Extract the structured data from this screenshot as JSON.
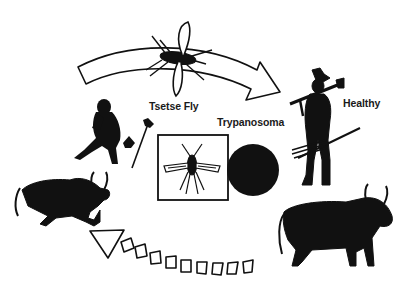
{
  "diagram": {
    "type": "disease transmission cycle",
    "labels": {
      "vector": "Tsetse Fly",
      "parasite": "Trypanosoma",
      "healthy": "Healthy"
    },
    "colors": {
      "ink": "#111111",
      "background": "#ffffff"
    },
    "nodes": [
      {
        "id": "flying-tsetse-fly",
        "desc": "tsetse fly in flight over top arrow"
      },
      {
        "id": "healthy-man",
        "desc": "standing man with hat carrying rifle and spears"
      },
      {
        "id": "healthy-cow",
        "desc": "standing humped cattle"
      },
      {
        "id": "sick-cow",
        "desc": "collapsing cattle"
      },
      {
        "id": "sick-person",
        "desc": "seated person holding head"
      },
      {
        "id": "tsetse-fly-box",
        "desc": "tsetse fly illustration inside square frame"
      },
      {
        "id": "trypanosoma-disc",
        "desc": "solid black circle representing parasite"
      }
    ],
    "edges": [
      {
        "from": "sick-person",
        "to": "healthy-man",
        "style": "solid outline curved arrow",
        "via": "Tsetse Fly"
      },
      {
        "from": "healthy-cow",
        "to": "sick-cow",
        "style": "segmented dashed arrow"
      }
    ]
  }
}
